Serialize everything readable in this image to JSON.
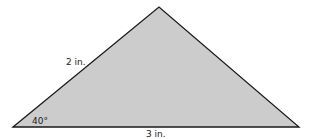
{
  "diagram": {
    "type": "triangle",
    "fill_color": "#cccccc",
    "stroke_color": "#1a1a1a",
    "vertices": {
      "bottom_left": [
        13,
        127
      ],
      "top": [
        159,
        7
      ],
      "bottom_right": [
        299,
        127
      ]
    },
    "labels": {
      "left_side": "2 in.",
      "base": "3 in.",
      "angle": "40°"
    }
  }
}
